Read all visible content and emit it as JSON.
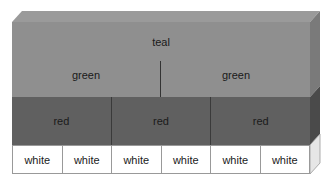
{
  "diagram": {
    "top": {
      "label": "teal",
      "color": "#8f8f8f"
    },
    "middle": [
      {
        "label": "green"
      },
      {
        "label": "green"
      }
    ],
    "red_row": [
      {
        "label": "red"
      },
      {
        "label": "red"
      },
      {
        "label": "red"
      }
    ],
    "white_row": [
      {
        "label": "white"
      },
      {
        "label": "white"
      },
      {
        "label": "white"
      },
      {
        "label": "white"
      },
      {
        "label": "white"
      },
      {
        "label": "white"
      }
    ],
    "colors": {
      "top_face": "#8f8f8f",
      "red_face": "#606060",
      "white_face": "#ffffff",
      "side_top": "#7a7a7a",
      "side_red": "#4a4a4a",
      "side_white": "#e6e6e6"
    }
  }
}
